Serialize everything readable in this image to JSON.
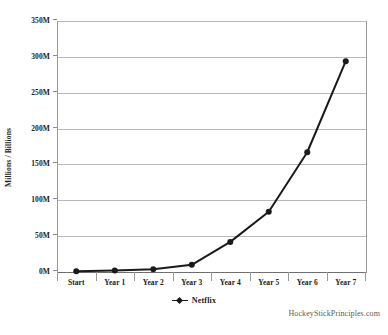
{
  "chart_data": {
    "type": "line",
    "title": "",
    "subtitle": "",
    "xlabel": "",
    "ylabel": "Millions / Billions",
    "categories": [
      "Start",
      "Year 1",
      "Year 2",
      "Year 3",
      "Year 4",
      "Year 5",
      "Year 6",
      "Year 7"
    ],
    "series": [
      {
        "name": "Netflix",
        "values": [
          1,
          2,
          4,
          10,
          42,
          84,
          167,
          294
        ],
        "color": "#1a1a1a",
        "marker": "circle"
      }
    ],
    "ylim": [
      0,
      350
    ],
    "ytick_values": [
      0,
      50,
      100,
      150,
      200,
      250,
      300,
      350
    ],
    "ytick_labels": [
      "0M",
      "50M",
      "100M",
      "150M",
      "200M",
      "250M",
      "300M",
      "350M"
    ],
    "grid": true,
    "grid_axis": "y",
    "legend_position": "bottom",
    "legend_entries": [
      "Netflix"
    ],
    "annotations": [
      "HockeyStickPrinciples.com"
    ]
  },
  "legend": {
    "netflix_label": "Netflix"
  },
  "footer": {
    "watermark": "HockeyStickPrinciples.com"
  },
  "colors": {
    "series_line": "#1a1a1a",
    "gridline": "#b9b9b9",
    "axis": "#777777",
    "background": "#ffffff",
    "text": "#222222"
  }
}
